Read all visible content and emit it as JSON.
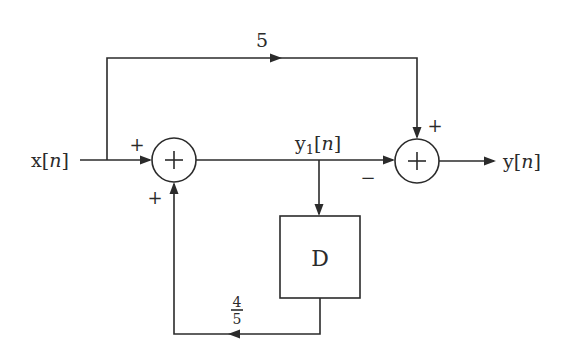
{
  "diagram": {
    "type": "block-diagram",
    "input_label": {
      "base": "x",
      "open": "[",
      "var": "n",
      "close": "]"
    },
    "output_label": {
      "base": "y",
      "open": "[",
      "var": "n",
      "close": "]"
    },
    "intermediate_label": {
      "base": "y",
      "sub": "1",
      "open": "[",
      "var": "n",
      "close": "]"
    },
    "feedforward_gain": "5",
    "feedback_gain": {
      "numerator": "4",
      "denominator": "5"
    },
    "delay_block": "D",
    "summers": [
      {
        "id": "sum1",
        "symbol": "+",
        "input_signs": [
          "+",
          "+"
        ]
      },
      {
        "id": "sum2",
        "symbol": "+",
        "input_signs": [
          "+",
          "−"
        ]
      }
    ],
    "line_color": "#2b2b2b",
    "background": "#ffffff"
  }
}
